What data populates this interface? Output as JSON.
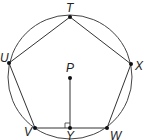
{
  "diagram": {
    "type": "inscribed regular pentagon",
    "circle": {
      "center": "P",
      "cx": 70,
      "cy": 77,
      "r": 62
    },
    "points": [
      {
        "name": "T",
        "x": 70,
        "y": 17,
        "lx": 66,
        "ly": 12
      },
      {
        "name": "U",
        "x": 9,
        "y": 63,
        "lx": 0,
        "ly": 62
      },
      {
        "name": "X",
        "x": 131,
        "y": 64,
        "lx": 135,
        "ly": 70
      },
      {
        "name": "V",
        "x": 35,
        "y": 128,
        "lx": 24,
        "ly": 136
      },
      {
        "name": "W",
        "x": 107,
        "y": 128,
        "lx": 110,
        "ly": 140
      },
      {
        "name": "P",
        "x": 70,
        "y": 78,
        "lx": 66,
        "ly": 72
      },
      {
        "name": "Y",
        "x": 70,
        "y": 128,
        "lx": 66,
        "ly": 140
      }
    ],
    "polygon": [
      "T",
      "X",
      "W",
      "V",
      "U"
    ],
    "segments": [
      [
        "P",
        "Y"
      ]
    ],
    "right_angle_at": "Y",
    "colors": {
      "stroke": "#333333",
      "point": "#111111"
    }
  }
}
